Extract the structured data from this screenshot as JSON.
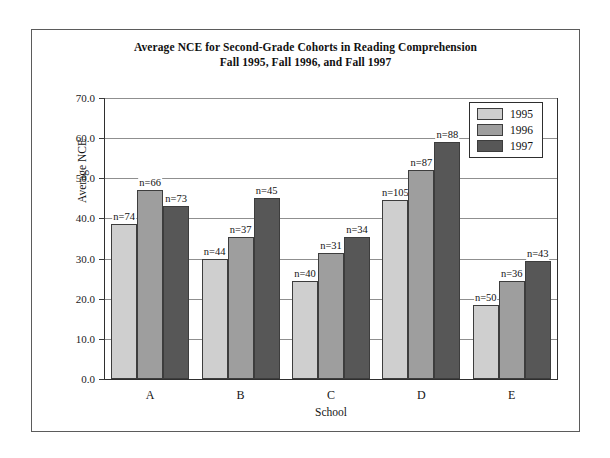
{
  "chart_data": {
    "type": "bar",
    "title": "Average NCE for Second-Grade Cohorts in Reading Comprehension Fall 1995, Fall 1996, and Fall 1997",
    "title_lines": [
      "Average NCE for Second-Grade Cohorts in Reading Comprehension",
      "Fall 1995, Fall 1996, and Fall 1997"
    ],
    "xlabel": "School",
    "ylabel": "Average NCE",
    "ylim": [
      0,
      70
    ],
    "ytick_step": 10,
    "ytick_labels": [
      "0.0",
      "10.0",
      "20.0",
      "30.0",
      "40.0",
      "50.0",
      "60.0",
      "70.0"
    ],
    "ytick_values": [
      0,
      10,
      20,
      30,
      40,
      50,
      60,
      70
    ],
    "grid": true,
    "legend_position": "top-right",
    "categories": [
      "A",
      "B",
      "C",
      "D",
      "E"
    ],
    "series": [
      {
        "name": "1995",
        "color": "#cfcfcf",
        "values": [
          38.5,
          30.0,
          24.5,
          44.5,
          18.5
        ],
        "point_labels": [
          "n=74",
          "n=44",
          "n=40",
          "n=105",
          "n=50"
        ]
      },
      {
        "name": "1996",
        "color": "#9e9e9e",
        "values": [
          47.0,
          35.5,
          31.5,
          52.0,
          24.5
        ],
        "point_labels": [
          "n=66",
          "n=37",
          "n=31",
          "n=87",
          "n=36"
        ]
      },
      {
        "name": "1997",
        "color": "#575757",
        "values": [
          43.0,
          45.0,
          35.5,
          59.0,
          29.5
        ],
        "point_labels": [
          "n=73",
          "n=45",
          "n=34",
          "n=88",
          "n=43"
        ]
      }
    ]
  },
  "legend": {
    "entries": [
      {
        "label": "1995",
        "color": "#cfcfcf"
      },
      {
        "label": "1996",
        "color": "#9e9e9e"
      },
      {
        "label": "1997",
        "color": "#575757"
      }
    ]
  },
  "colors": {
    "series_1995": "#cfcfcf",
    "series_1996": "#9e9e9e",
    "series_1997": "#575757",
    "bar_outline": "#3d3d3d",
    "axis": "#2f2f2f",
    "gridline": "#8f8f8f",
    "frame": "#5b5b5b",
    "text": "#111111",
    "background": "#ffffff"
  }
}
